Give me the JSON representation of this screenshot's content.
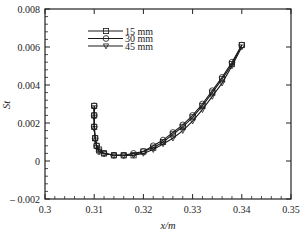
{
  "chart_data": {
    "type": "line",
    "title": "",
    "xlabel": "x/m",
    "ylabel": "St",
    "xlim": [
      0.3,
      0.35
    ],
    "ylim": [
      -0.002,
      0.008
    ],
    "xticks": [
      "0.3",
      "0.31",
      "0.32",
      "0.33",
      "0.34",
      "0.35"
    ],
    "yticks": [
      "0.008",
      "0.006",
      "0.004",
      "0.002",
      "0",
      "– 0.002"
    ],
    "grid": false,
    "legend_position": "upper-left-center",
    "series": [
      {
        "name": "15 mm",
        "marker": "square",
        "x": [
          0.31,
          0.31,
          0.31,
          0.3102,
          0.3105,
          0.311,
          0.312,
          0.314,
          0.316,
          0.318,
          0.32,
          0.322,
          0.324,
          0.326,
          0.328,
          0.33,
          0.332,
          0.334,
          0.336,
          0.338,
          0.34
        ],
        "y": [
          0.0029,
          0.0024,
          0.0018,
          0.0012,
          0.0008,
          0.0006,
          0.0004,
          0.0003,
          0.0003,
          0.0003,
          0.0005,
          0.0007,
          0.001,
          0.0014,
          0.0018,
          0.0023,
          0.0029,
          0.0036,
          0.0043,
          0.0051,
          0.0061
        ]
      },
      {
        "name": "30 mm",
        "marker": "circle",
        "x": [
          0.31,
          0.31,
          0.31,
          0.3102,
          0.3105,
          0.311,
          0.312,
          0.314,
          0.316,
          0.318,
          0.32,
          0.322,
          0.324,
          0.326,
          0.328,
          0.33,
          0.332,
          0.334,
          0.336,
          0.338,
          0.34
        ],
        "y": [
          0.0029,
          0.0024,
          0.0018,
          0.0012,
          0.0008,
          0.0005,
          0.0004,
          0.0003,
          0.0003,
          0.0004,
          0.0005,
          0.0008,
          0.0011,
          0.0015,
          0.0019,
          0.0024,
          0.003,
          0.0037,
          0.0044,
          0.0052,
          0.0061
        ]
      },
      {
        "name": "45 mm",
        "marker": "triangle-down",
        "x": [
          0.31,
          0.31,
          0.31,
          0.3102,
          0.3105,
          0.311,
          0.312,
          0.314,
          0.316,
          0.318,
          0.32,
          0.322,
          0.324,
          0.326,
          0.328,
          0.33,
          0.332,
          0.334,
          0.336,
          0.338,
          0.34
        ],
        "y": [
          0.0028,
          0.0023,
          0.0017,
          0.0011,
          0.0007,
          0.0005,
          0.0004,
          0.0003,
          0.0003,
          0.0003,
          0.0004,
          0.0006,
          0.0009,
          0.0012,
          0.0016,
          0.0021,
          0.0027,
          0.0034,
          0.0041,
          0.005,
          0.006
        ]
      }
    ]
  },
  "legend": {
    "items": [
      {
        "label": "15 mm",
        "marker": "square"
      },
      {
        "label": "30 mm",
        "marker": "circle"
      },
      {
        "label": "45 mm",
        "marker": "triangle-down"
      }
    ]
  },
  "axes": {
    "xlabel": "x/m",
    "ylabel": "St"
  },
  "colors": {
    "line": "#1a1a1a",
    "axis": "#222222",
    "background": "#ffffff"
  }
}
